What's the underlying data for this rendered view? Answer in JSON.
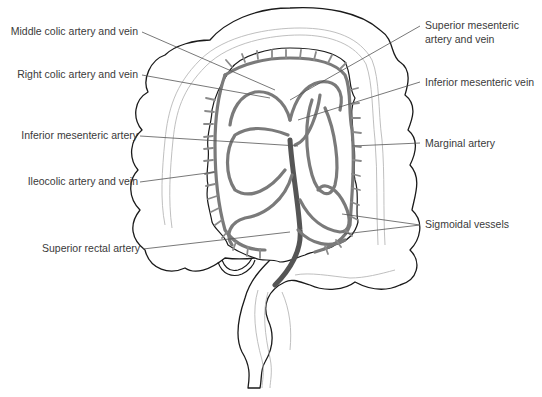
{
  "figure": {
    "labels": {
      "middle_colic": "Middle colic artery and vein",
      "right_colic": "Right colic artery and vein",
      "inferior_mesenteric_artery": "Inferior mesenteric artery",
      "ileocolic": "Ileocolic artery and vein",
      "superior_rectal": "Superior rectal artery",
      "superior_mesenteric_line1": "Superior mesenteric",
      "superior_mesenteric_line2": "artery and vein",
      "inferior_mesenteric_vein": "Inferior mesenteric vein",
      "marginal_artery": "Marginal artery",
      "sigmoidal_vessels": "Sigmoidal vessels"
    },
    "colors": {
      "outline": "#1a1a1a",
      "vessel": "#7a7a7a",
      "leader": "#555555",
      "text": "#3a3a3a"
    }
  }
}
